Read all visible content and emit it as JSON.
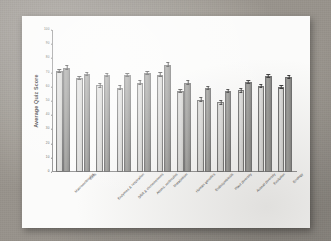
{
  "chart_data": {
    "type": "bar",
    "title": "",
    "xlabel": "",
    "ylabel": "Average Quiz Score",
    "ylim": [
      0,
      100
    ],
    "yticks": [
      0,
      10,
      20,
      30,
      40,
      50,
      60,
      70,
      80,
      90,
      100
    ],
    "grid": false,
    "legend": "none",
    "error_bars": true,
    "categories": [
      "Macromolecules",
      "Cells",
      "Enzymes & respiration",
      "DNA & chromosomes",
      "Atoms, molecules",
      "Metabolism",
      "Human genetics",
      "Endosymbiosis",
      "Plant diversity",
      "Animal diversity",
      "Evolution",
      "Ecology"
    ],
    "series": [
      {
        "name": "Series 1",
        "color": "#d8d8d4",
        "values": [
          71,
          66,
          61,
          59.5,
          63,
          68.5,
          57,
          51,
          49,
          57.5,
          60.5,
          60
        ],
        "errors": [
          1.2,
          1.1,
          1.2,
          1.2,
          1.1,
          1.3,
          1.2,
          1.3,
          1.3,
          1.2,
          1.2,
          1.2
        ]
      },
      {
        "name": "Series 2",
        "color": "#949492",
        "values": [
          73.5,
          69,
          68,
          68,
          70,
          75.5,
          63,
          59,
          57,
          63.5,
          67.5,
          67
        ],
        "errors": [
          1.2,
          1.1,
          1.1,
          1.1,
          1.1,
          1.3,
          1.2,
          1.2,
          1.2,
          1.2,
          1.2,
          1.2
        ]
      }
    ]
  },
  "axis": {
    "y_title": "Average Quiz Score",
    "ticks": [
      "100",
      "90",
      "80",
      "70",
      "60",
      "50",
      "40",
      "30",
      "20",
      "10",
      "0"
    ]
  }
}
